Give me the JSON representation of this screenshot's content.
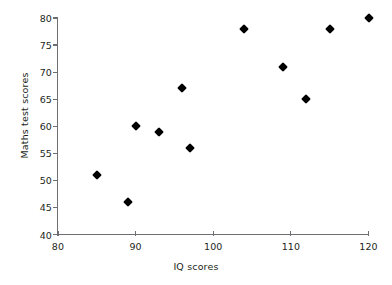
{
  "chart_data": {
    "type": "scatter",
    "title": "",
    "xlabel": "IQ scores",
    "ylabel": "Maths test scores",
    "xlim": [
      80,
      120
    ],
    "ylim": [
      40,
      80
    ],
    "xticks": [
      80,
      90,
      100,
      110,
      120
    ],
    "yticks": [
      40,
      45,
      50,
      55,
      60,
      65,
      70,
      75,
      80
    ],
    "xtick_labels": [
      "80",
      "90",
      "100",
      "110",
      "120"
    ],
    "ytick_labels": [
      "40",
      "45",
      "50",
      "55",
      "60",
      "65",
      "70",
      "75",
      "80"
    ],
    "grid": false,
    "legend": null,
    "marker": "diamond",
    "marker_color": "#000000",
    "axis_color": "#6d6e71",
    "points": [
      {
        "x": 85,
        "y": 51
      },
      {
        "x": 89,
        "y": 46
      },
      {
        "x": 90,
        "y": 60
      },
      {
        "x": 93,
        "y": 59
      },
      {
        "x": 96,
        "y": 67
      },
      {
        "x": 97,
        "y": 56
      },
      {
        "x": 104,
        "y": 78
      },
      {
        "x": 109,
        "y": 71
      },
      {
        "x": 112,
        "y": 65
      },
      {
        "x": 115,
        "y": 78
      },
      {
        "x": 120,
        "y": 80
      }
    ]
  }
}
